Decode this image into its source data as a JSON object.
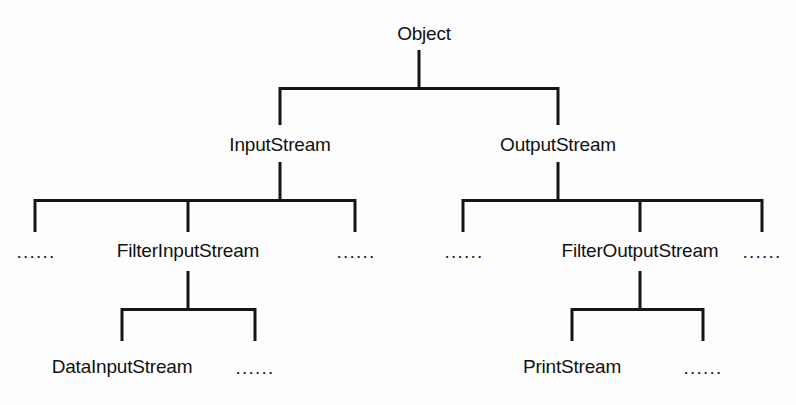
{
  "diagram": {
    "type": "tree",
    "ellipsis_glyph": "......",
    "line_color": "#151515",
    "text_color": "#111111",
    "background_color": "#fefefe",
    "nodes": {
      "object": "Object",
      "input_stream": "InputStream",
      "output_stream": "OutputStream",
      "filter_input_stream": "FilterInputStream",
      "filter_output_stream": "FilterOutputStream",
      "data_input_stream": "DataInputStream",
      "print_stream": "PrintStream",
      "ellipsis_input_left": "......",
      "ellipsis_input_right": "......",
      "ellipsis_output_left": "......",
      "ellipsis_output_right": "......",
      "ellipsis_data_input": "......",
      "ellipsis_print": "......"
    },
    "levels": [
      [
        "Object"
      ],
      [
        "InputStream",
        "OutputStream"
      ],
      [
        "......",
        "FilterInputStream",
        "......",
        "......",
        "FilterOutputStream",
        "......"
      ],
      [
        "DataInputStream",
        "......",
        "PrintStream",
        "......"
      ]
    ],
    "edges": [
      {
        "from": "Object",
        "to": "InputStream"
      },
      {
        "from": "Object",
        "to": "OutputStream"
      },
      {
        "from": "InputStream",
        "to": "......"
      },
      {
        "from": "InputStream",
        "to": "FilterInputStream"
      },
      {
        "from": "InputStream",
        "to": "......"
      },
      {
        "from": "OutputStream",
        "to": "......"
      },
      {
        "from": "OutputStream",
        "to": "FilterOutputStream"
      },
      {
        "from": "OutputStream",
        "to": "......"
      },
      {
        "from": "FilterInputStream",
        "to": "DataInputStream"
      },
      {
        "from": "FilterInputStream",
        "to": "......"
      },
      {
        "from": "FilterOutputStream",
        "to": "PrintStream"
      },
      {
        "from": "FilterOutputStream",
        "to": "......"
      }
    ]
  }
}
